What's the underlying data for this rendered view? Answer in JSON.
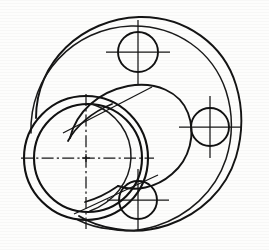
{
  "document": {
    "kind": "engineering-drawing",
    "subject": "Flanged bearing housing / eccentric bore cover plate",
    "style": "hand-inked scanned line drawing",
    "view": "pictorial / oblique section view",
    "background_color": "#fdfdfc",
    "line_color": "#141414"
  },
  "geometry": {
    "flange_outer": {
      "name": "outer flange rim",
      "center_x": 133,
      "center_y": 122,
      "radius_x": 103,
      "radius_y": 97,
      "rotation_deg": -8
    },
    "flange_inner": {
      "name": "inner flange face rim",
      "center_x": 124,
      "center_y": 124,
      "radius_x": 95,
      "radius_y": 96,
      "rotation_deg": -6
    },
    "boss_outer": {
      "name": "raised cylindrical boss front face",
      "center_x": 86,
      "center_y": 158,
      "radius": 62
    },
    "boss_inner": {
      "name": "boss bore inner wall",
      "center_x": 88,
      "center_y": 158,
      "radius": 54
    },
    "bore_rear": {
      "name": "rear bore ellipse",
      "center_x": 118,
      "center_y": 147,
      "radius": 52
    },
    "holes": [
      {
        "id": "hole-top",
        "label": "bolt hole top",
        "cx": 138,
        "cy": 52,
        "r": 20,
        "cross_len": 32
      },
      {
        "id": "hole-right",
        "label": "bolt hole right",
        "cx": 210,
        "cy": 127,
        "r": 19,
        "cross_len": 31
      },
      {
        "id": "hole-bottom",
        "label": "bolt hole bottom",
        "cx": 138,
        "cy": 200,
        "r": 19,
        "cross_len": 31
      }
    ],
    "centerlines": {
      "horizontal": {
        "y": 158,
        "x1": 21,
        "x2": 154
      },
      "vertical": {
        "x": 86,
        "y1": 94,
        "y2": 229
      }
    }
  },
  "annotations": {
    "title": "",
    "notes": [],
    "dimensions": []
  }
}
